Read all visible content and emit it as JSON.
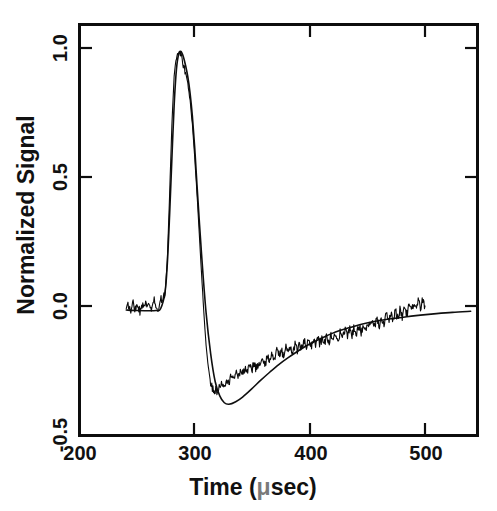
{
  "figure": {
    "background_color": "#ffffff",
    "ink_color": "#0d0d0d"
  },
  "axes": {
    "x": {
      "title": "Time (",
      "title_unit": "μ",
      "title_tail": "sec)",
      "title_full": "Time (μsec)",
      "tick_labels": [
        "200",
        "300",
        "400",
        "500"
      ],
      "tick_values": [
        200,
        300,
        400,
        500
      ],
      "range": [
        197,
        546
      ]
    },
    "y": {
      "title": "Normalized Signal",
      "tick_labels": [
        "1.0",
        "0.5",
        "0.0",
        "-0.5"
      ],
      "tick_values": [
        1.0,
        0.5,
        0.0,
        -0.5
      ],
      "range": [
        -0.5,
        1.105
      ]
    }
  },
  "chart_data": {
    "type": "line",
    "title": "",
    "xlabel": "Time (μsec)",
    "ylabel": "Normalized Signal",
    "xlim": [
      197,
      546
    ],
    "ylim": [
      -0.5,
      1.105
    ],
    "xticks": [
      200,
      300,
      400,
      500
    ],
    "yticks": [
      -0.5,
      0.0,
      0.5,
      1.0
    ],
    "grid": false,
    "legend": "none",
    "series": [
      {
        "name": "measured signal",
        "style": "noisy-trace",
        "color": "#0a0a0a",
        "x": [
          238,
          240,
          242,
          244,
          246,
          248,
          250,
          252,
          254,
          256,
          258,
          260,
          262,
          264,
          266,
          268,
          270,
          272,
          274,
          276,
          278,
          280,
          282,
          284,
          286,
          288,
          290,
          292,
          294,
          296,
          298,
          300,
          302,
          304,
          306,
          308,
          310,
          312,
          314,
          316,
          318,
          320,
          322,
          324,
          326,
          328,
          330,
          332,
          334,
          336,
          338,
          340,
          342,
          344,
          346,
          348,
          350,
          352,
          354,
          356,
          358,
          360,
          362,
          364,
          366,
          368,
          370,
          372,
          374,
          376,
          378,
          380,
          382,
          384,
          386,
          388,
          390,
          392,
          394,
          396,
          398,
          400,
          402,
          404,
          406,
          408,
          410,
          412,
          414,
          416,
          418,
          420,
          422,
          424,
          426,
          428,
          430,
          432,
          434,
          436,
          438,
          440,
          442,
          444,
          446,
          448,
          450,
          452,
          454,
          456,
          458,
          460,
          462,
          464,
          466,
          468,
          470,
          472,
          474,
          476,
          478,
          480,
          482,
          484,
          486,
          488,
          490,
          492,
          494,
          496,
          498,
          500
        ],
        "y": [
          -0.012,
          0.012,
          -0.018,
          0.021,
          -0.006,
          0.017,
          -0.021,
          0.009,
          0.026,
          -0.008,
          0.019,
          -0.014,
          0.031,
          0.004,
          -0.017,
          0.028,
          0.041,
          0.052,
          0.185,
          0.436,
          0.713,
          0.906,
          0.982,
          1.0,
          0.986,
          0.952,
          0.916,
          0.874,
          0.808,
          0.714,
          0.592,
          0.447,
          0.292,
          0.134,
          -0.018,
          -0.146,
          -0.236,
          -0.291,
          -0.318,
          -0.327,
          -0.322,
          -0.312,
          -0.289,
          -0.303,
          -0.276,
          -0.291,
          -0.262,
          -0.279,
          -0.255,
          -0.268,
          -0.243,
          -0.258,
          -0.234,
          -0.248,
          -0.229,
          -0.241,
          -0.225,
          -0.236,
          -0.219,
          -0.228,
          -0.205,
          -0.216,
          -0.193,
          -0.204,
          -0.182,
          -0.192,
          -0.172,
          -0.183,
          -0.164,
          -0.197,
          -0.155,
          -0.186,
          -0.149,
          -0.178,
          -0.143,
          -0.171,
          -0.138,
          -0.165,
          -0.132,
          -0.159,
          -0.128,
          -0.154,
          -0.122,
          -0.149,
          -0.118,
          -0.144,
          -0.113,
          -0.139,
          -0.108,
          -0.134,
          -0.104,
          -0.129,
          -0.098,
          -0.124,
          -0.093,
          -0.118,
          -0.088,
          -0.112,
          -0.082,
          -0.106,
          -0.076,
          -0.101,
          -0.07,
          -0.095,
          -0.064,
          -0.089,
          -0.057,
          -0.082,
          -0.05,
          -0.076,
          -0.044,
          -0.07,
          -0.037,
          -0.063,
          -0.03,
          -0.056,
          -0.023,
          -0.049,
          -0.016,
          -0.042,
          -0.008,
          -0.034,
          0.0,
          -0.026,
          0.008,
          -0.018,
          0.016,
          -0.01,
          0.023,
          -0.002,
          0.03,
          0.006
        ]
      },
      {
        "name": "model fit",
        "style": "smooth-curve",
        "color": "#0f0f0f",
        "x": [
          238,
          248,
          258,
          264,
          268,
          272,
          274,
          276,
          278,
          280,
          282,
          284,
          286,
          288,
          290,
          292,
          294,
          296,
          298,
          300,
          304,
          308,
          312,
          316,
          320,
          324,
          328,
          334,
          340,
          348,
          356,
          364,
          372,
          380,
          390,
          400,
          412,
          424,
          436,
          448,
          460,
          472,
          484,
          496,
          510,
          524,
          540
        ],
        "y": [
          -0.01,
          -0.012,
          -0.013,
          -0.012,
          -0.006,
          0.06,
          0.17,
          0.36,
          0.58,
          0.79,
          0.93,
          0.99,
          1.0,
          0.98,
          0.945,
          0.9,
          0.835,
          0.745,
          0.625,
          0.48,
          0.21,
          -0.02,
          -0.18,
          -0.29,
          -0.345,
          -0.372,
          -0.378,
          -0.368,
          -0.35,
          -0.318,
          -0.284,
          -0.252,
          -0.222,
          -0.196,
          -0.166,
          -0.14,
          -0.114,
          -0.092,
          -0.076,
          -0.062,
          -0.051,
          -0.043,
          -0.036,
          -0.03,
          -0.024,
          -0.019,
          -0.015
        ]
      }
    ]
  }
}
